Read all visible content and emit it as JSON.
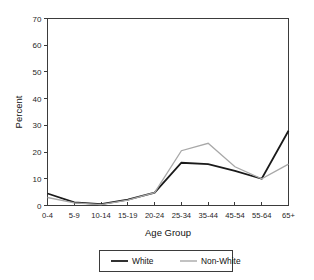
{
  "chart_data": {
    "type": "line",
    "title": "",
    "xlabel": "Age Group",
    "ylabel": "Percent",
    "categories": [
      "0-4",
      "5-9",
      "10-14",
      "15-19",
      "20-24",
      "25-34",
      "35-44",
      "45-54",
      "55-64",
      "65+"
    ],
    "series": [
      {
        "name": "White",
        "color": "#1a1a1a",
        "values": [
          4.5,
          1.2,
          0.5,
          2.2,
          4.8,
          16.0,
          15.5,
          13.0,
          10.0,
          28.0
        ]
      },
      {
        "name": "Non-White",
        "color": "#a8a8a8",
        "values": [
          3.0,
          1.0,
          0.3,
          2.0,
          4.8,
          20.5,
          23.3,
          14.5,
          10.0,
          15.5
        ]
      }
    ],
    "ylim": [
      0,
      70
    ],
    "yticks": [
      0,
      10,
      20,
      30,
      40,
      50,
      60,
      70
    ],
    "ytick_labels": [
      "0",
      "10",
      "20",
      "30",
      "40",
      "50",
      "60",
      "70"
    ],
    "grid": false,
    "legend_position": "bottom-center",
    "frame": "box"
  },
  "axes": {
    "y_title": "Percent",
    "x_title": "Age Group"
  },
  "legend": {
    "entries": [
      {
        "label": "White",
        "color": "#1a1a1a",
        "width": 1.8
      },
      {
        "label": "Non-White",
        "color": "#a8a8a8",
        "width": 1.4
      }
    ]
  },
  "colors": {
    "background": "#ffffff",
    "frame": "#3b3b3b",
    "text": "#1a1a1a",
    "white_series": "#1a1a1a",
    "nonwhite_series": "#a8a8a8"
  }
}
